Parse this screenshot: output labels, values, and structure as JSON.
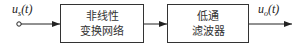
{
  "diagram": {
    "input_signal": {
      "base": "u",
      "sub": "s",
      "arg": "(t)"
    },
    "output_signal": {
      "base": "u",
      "sub": "o",
      "arg": "(t)"
    },
    "blocks": [
      {
        "line1": "非线性",
        "line2": "变换网络"
      },
      {
        "line1": "低通",
        "line2": "滤波器"
      }
    ],
    "edges": [
      {
        "from": "input",
        "to": "block-0"
      },
      {
        "from": "block-0",
        "to": "block-1"
      },
      {
        "from": "block-1",
        "to": "output"
      }
    ]
  }
}
